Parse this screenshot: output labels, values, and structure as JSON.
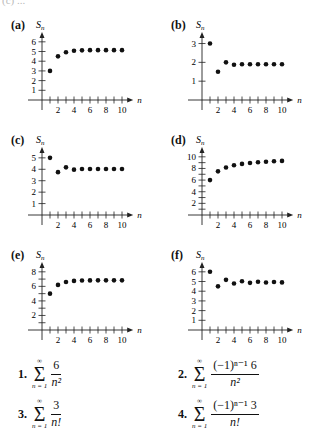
{
  "top_fragment": "(c) ...",
  "chart_data": [
    {
      "id": "a",
      "label": "(a)",
      "type": "scatter",
      "xlabel": "n",
      "ylabel": "S_n",
      "x": [
        1,
        2,
        3,
        4,
        5,
        6,
        7,
        8,
        9,
        10
      ],
      "values": [
        3.0,
        4.5,
        4.93,
        5.08,
        5.12,
        5.14,
        5.14,
        5.14,
        5.14,
        5.14
      ],
      "yticks": [
        1,
        2,
        3,
        4,
        5,
        6
      ],
      "ytick_labels": [
        "1",
        "2",
        "3",
        "4",
        "5",
        "6"
      ],
      "xticks_labeled": [
        2,
        4,
        6,
        8,
        10
      ],
      "ylim": [
        0,
        6.6
      ],
      "xlim": [
        0,
        11
      ]
    },
    {
      "id": "b",
      "label": "(b)",
      "type": "scatter",
      "xlabel": "n",
      "ylabel": "S_n",
      "x": [
        1,
        2,
        3,
        4,
        5,
        6,
        7,
        8,
        9,
        10
      ],
      "values": [
        3.0,
        1.5,
        2.0,
        1.875,
        1.9,
        1.896,
        1.896,
        1.896,
        1.896,
        1.896
      ],
      "yticks": [
        1,
        2,
        3
      ],
      "ytick_labels": [
        "1",
        "2",
        "3"
      ],
      "xticks_labeled": [
        2,
        4,
        6,
        8,
        10
      ],
      "ylim": [
        0,
        3.4
      ],
      "xlim": [
        0,
        11
      ]
    },
    {
      "id": "c",
      "label": "(c)",
      "type": "scatter",
      "xlabel": "n",
      "ylabel": "S_n",
      "x": [
        1,
        2,
        3,
        4,
        5,
        6,
        7,
        8,
        9,
        10
      ],
      "values": [
        5.0,
        3.75,
        4.17,
        3.97,
        4.03,
        4.02,
        4.02,
        4.02,
        4.02,
        4.02
      ],
      "yticks": [
        1,
        2,
        3,
        4,
        5
      ],
      "ytick_labels": [
        "1",
        "2",
        "3",
        "4",
        "5"
      ],
      "xticks_labeled": [
        2,
        4,
        6,
        8,
        10
      ],
      "ylim": [
        0,
        5.6
      ],
      "xlim": [
        0,
        11
      ]
    },
    {
      "id": "d",
      "label": "(d)",
      "type": "scatter",
      "xlabel": "n",
      "ylabel": "S_n",
      "x": [
        1,
        2,
        3,
        4,
        5,
        6,
        7,
        8,
        9,
        10
      ],
      "values": [
        6.0,
        7.5,
        8.17,
        8.54,
        8.78,
        8.95,
        9.07,
        9.16,
        9.24,
        9.3
      ],
      "yticks": [
        1,
        2,
        3,
        4,
        5,
        6,
        7,
        8,
        9,
        10
      ],
      "ytick_labels": [
        "",
        "2",
        "",
        "4",
        "",
        "6",
        "",
        "8",
        "",
        "10"
      ],
      "xticks_labeled": [
        2,
        4,
        6,
        8,
        10
      ],
      "ylim": [
        0,
        11
      ],
      "xlim": [
        0,
        11
      ]
    },
    {
      "id": "e",
      "label": "(e)",
      "type": "scatter",
      "xlabel": "n",
      "ylabel": "S_n",
      "x": [
        1,
        2,
        3,
        4,
        5,
        6,
        7,
        8,
        9,
        10
      ],
      "values": [
        5.0,
        6.2,
        6.6,
        6.75,
        6.8,
        6.82,
        6.83,
        6.83,
        6.83,
        6.83
      ],
      "yticks": [
        1,
        2,
        3,
        4,
        5,
        6,
        7,
        8
      ],
      "ytick_labels": [
        "",
        "2",
        "",
        "4",
        "",
        "6",
        "",
        "8"
      ],
      "xticks_labeled": [
        2,
        4,
        6,
        8,
        10
      ],
      "ylim": [
        0,
        8.8
      ],
      "xlim": [
        0,
        11
      ]
    },
    {
      "id": "f",
      "label": "(f)",
      "type": "scatter",
      "xlabel": "n",
      "ylabel": "S_n",
      "x": [
        1,
        2,
        3,
        4,
        5,
        6,
        7,
        8,
        9,
        10
      ],
      "values": [
        6.0,
        4.5,
        5.17,
        4.79,
        5.03,
        4.86,
        4.97,
        4.9,
        4.95,
        4.91
      ],
      "yticks": [
        1,
        2,
        3,
        4,
        5,
        6
      ],
      "ytick_labels": [
        "1",
        "2",
        "3",
        "4",
        "5",
        "6"
      ],
      "xticks_labeled": [
        2,
        4,
        6,
        8,
        10
      ],
      "ylim": [
        0,
        6.6
      ],
      "xlim": [
        0,
        11
      ]
    }
  ],
  "formulas": [
    {
      "num": "1.",
      "sum_top": "∞",
      "sum_bottom": "n = 1",
      "numerator": "6",
      "denominator": "n²"
    },
    {
      "num": "2.",
      "sum_top": "∞",
      "sum_bottom": "n = 1",
      "numerator": "(−1)ⁿ⁻¹ 6",
      "denominator": "n²"
    },
    {
      "num": "3.",
      "sum_top": "∞",
      "sum_bottom": "n = 1",
      "numerator": "3",
      "denominator": "n!"
    },
    {
      "num": "4.",
      "sum_top": "∞",
      "sum_bottom": "n = 1",
      "numerator": "(−1)ⁿ⁻¹ 3",
      "denominator": "n!"
    }
  ]
}
